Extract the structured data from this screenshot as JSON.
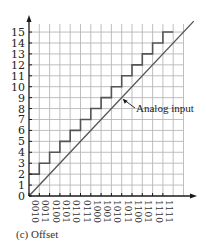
{
  "chart_data": {
    "type": "line",
    "title": "",
    "caption": "(c)  Offset",
    "xlabel": "",
    "ylabel": "",
    "x_ticks": [
      "0010",
      "0011",
      "0100",
      "0101",
      "0110",
      "0111",
      "1000",
      "1001",
      "1010",
      "1011",
      "1100",
      "1101",
      "1110",
      "1111"
    ],
    "y_ticks": [
      0,
      1,
      2,
      3,
      4,
      5,
      6,
      7,
      8,
      9,
      10,
      11,
      12,
      13,
      14,
      15
    ],
    "ylim": [
      0,
      15
    ],
    "grid": true,
    "series": [
      {
        "name": "Offset output (staircase)",
        "style": "step",
        "x": [
          0,
          1,
          2,
          3,
          4,
          5,
          6,
          7,
          8,
          9,
          10,
          11,
          12,
          13
        ],
        "values": [
          2,
          3,
          4,
          5,
          6,
          7,
          8,
          9,
          10,
          11,
          12,
          13,
          14,
          15
        ]
      },
      {
        "name": "Analog input",
        "style": "line",
        "x": [
          0,
          16
        ],
        "values": [
          0,
          16
        ]
      }
    ],
    "annotations": [
      {
        "text": "Analog input",
        "points_to": [
          9,
          9
        ]
      }
    ]
  },
  "colors": {
    "grid": "#b8b8b8",
    "axis": "#1a1a1a",
    "staircase": "#555555",
    "input_line": "#555555"
  }
}
